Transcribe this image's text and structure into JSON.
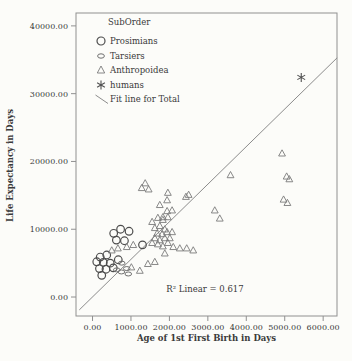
{
  "colors": {
    "paper": "#fcfcf9",
    "ink": "#3a3a3a",
    "axis": "#909090",
    "prosimians": "#4d4d4d",
    "tarsiers": "#6e6e6e",
    "anthropoidea": "#7a7a7a",
    "humans": "#525252",
    "fit_line": "#8c8c8c"
  },
  "chart_data": {
    "type": "scatter",
    "xlabel": "Age of 1st First Birth in Days",
    "ylabel": "Life Expectancy in Days",
    "annotation": "R² Linear = 0.617",
    "r_squared": 0.617,
    "x_range": [
      -430,
      6360
    ],
    "y_range": [
      -2800,
      41900
    ],
    "grid": false,
    "legend_position": "top-left-inside",
    "x_ticks": [
      {
        "value": 0,
        "label": "0.00"
      },
      {
        "value": 1000,
        "label": "1000.00"
      },
      {
        "value": 2000,
        "label": "2000.00"
      },
      {
        "value": 3000,
        "label": "3000.00"
      },
      {
        "value": 4000,
        "label": "4000.00"
      },
      {
        "value": 5000,
        "label": "5000.00"
      },
      {
        "value": 6000,
        "label": "6000.00"
      }
    ],
    "y_ticks": [
      {
        "value": 0,
        "label": "0.00"
      },
      {
        "value": 10000,
        "label": "10000.00"
      },
      {
        "value": 20000,
        "label": "20000.00"
      },
      {
        "value": 30000,
        "label": "30000.00"
      },
      {
        "value": 40000,
        "label": "40000.00"
      }
    ],
    "legend": {
      "title": "SubOrder",
      "items": [
        {
          "label": "Prosimians",
          "symbol": "circle"
        },
        {
          "label": "Tarsiers",
          "symbol": "ellipse"
        },
        {
          "label": "Anthropoidea",
          "symbol": "triangle"
        },
        {
          "label": "humans",
          "symbol": "asterisk"
        },
        {
          "label": "Fit line for Total",
          "symbol": "line"
        }
      ]
    },
    "series": [
      {
        "name": "Prosimians",
        "symbol": "circle",
        "points": [
          [
            550,
            9400
          ],
          [
            730,
            10000
          ],
          [
            950,
            9700
          ],
          [
            620,
            8400
          ],
          [
            830,
            8300
          ],
          [
            1300,
            7700
          ],
          [
            670,
            5500
          ],
          [
            370,
            6200
          ],
          [
            200,
            5900
          ],
          [
            110,
            5200
          ],
          [
            280,
            5100
          ],
          [
            460,
            5000
          ],
          [
            540,
            4300
          ],
          [
            180,
            4200
          ],
          [
            350,
            4100
          ],
          [
            240,
            3200
          ]
        ]
      },
      {
        "name": "Tarsiers",
        "symbol": "ellipse",
        "points": [
          [
            760,
            5000
          ],
          [
            890,
            4200
          ],
          [
            630,
            4000
          ],
          [
            750,
            3700
          ],
          [
            930,
            3400
          ]
        ]
      },
      {
        "name": "Anthropoidea",
        "symbol": "triangle",
        "points": [
          [
            1280,
            16100
          ],
          [
            1370,
            16800
          ],
          [
            1460,
            15900
          ],
          [
            1940,
            14300
          ],
          [
            1960,
            15400
          ],
          [
            2430,
            14800
          ],
          [
            2500,
            15100
          ],
          [
            1750,
            13600
          ],
          [
            1940,
            12700
          ],
          [
            2070,
            12800
          ],
          [
            1830,
            11800
          ],
          [
            1960,
            11800
          ],
          [
            1550,
            11100
          ],
          [
            1700,
            11700
          ],
          [
            1830,
            11400
          ],
          [
            1620,
            10200
          ],
          [
            1750,
            10500
          ],
          [
            1880,
            10000
          ],
          [
            1680,
            9400
          ],
          [
            1810,
            9300
          ],
          [
            1940,
            9600
          ],
          [
            1620,
            8700
          ],
          [
            1750,
            8400
          ],
          [
            1880,
            8700
          ],
          [
            1700,
            7800
          ],
          [
            1830,
            7500
          ],
          [
            1550,
            8000
          ],
          [
            1960,
            8000
          ],
          [
            2010,
            8700
          ],
          [
            2070,
            9600
          ],
          [
            2100,
            7400
          ],
          [
            2270,
            7200
          ],
          [
            2450,
            7200
          ],
          [
            2620,
            6900
          ],
          [
            1880,
            6450
          ],
          [
            1620,
            5200
          ],
          [
            1440,
            4900
          ],
          [
            1230,
            3900
          ],
          [
            1010,
            4400
          ],
          [
            500,
            6900
          ],
          [
            660,
            7200
          ],
          [
            890,
            7400
          ],
          [
            1060,
            7700
          ],
          [
            3180,
            12800
          ],
          [
            3310,
            11600
          ],
          [
            3590,
            18000
          ],
          [
            4930,
            21200
          ],
          [
            5050,
            17800
          ],
          [
            5120,
            17400
          ],
          [
            4970,
            14400
          ],
          [
            5070,
            13900
          ]
        ]
      },
      {
        "name": "humans",
        "symbol": "asterisk",
        "points": [
          [
            5430,
            32400
          ]
        ]
      }
    ],
    "fit_line": {
      "name": "Fit line for Total",
      "x1": -345,
      "y1": -1900,
      "x2": 6365,
      "y2": 35300
    }
  }
}
